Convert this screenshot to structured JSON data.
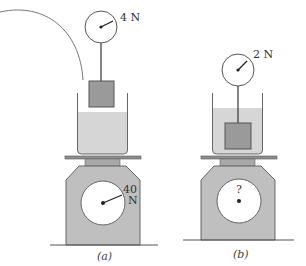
{
  "figure": {
    "panels": [
      {
        "id": "a",
        "caption": "(a)",
        "spring_scale_reading": "4 N",
        "balance_reading_line1": "40",
        "balance_reading_line2": "N",
        "block_position": "above water surface, hanging in air",
        "has_curved_line": true
      },
      {
        "id": "b",
        "caption": "(b)",
        "spring_scale_reading": "2 N",
        "balance_reading": "?",
        "block_position": "submerged in water"
      }
    ],
    "colors": {
      "outline": "#555555",
      "block": "#9a9a9a",
      "water": "#d6d6d6",
      "balance_body": "#bfbfbf",
      "plate": "#8f8f8f",
      "platform": "#a8a8a8"
    }
  }
}
